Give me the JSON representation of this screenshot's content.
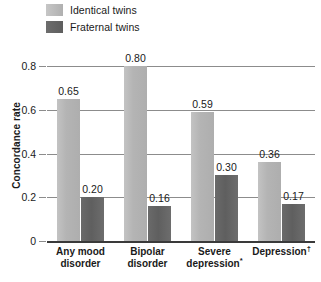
{
  "chart_data": {
    "type": "bar",
    "title": "",
    "subtitle": "",
    "xlabel": "",
    "ylabel": "Concordance rate",
    "ylim": [
      0,
      0.8
    ],
    "grid": true,
    "legend_position": "top-left",
    "categories": [
      "Any mood disorder",
      "Bipolar disorder",
      "Severe depression*",
      "Depression†"
    ],
    "category_lines": [
      [
        "Any mood",
        "disorder"
      ],
      [
        "Bipolar",
        "disorder"
      ],
      [
        "Severe",
        "depression*"
      ],
      [
        "Depression†",
        ""
      ]
    ],
    "y_ticks": [
      "0",
      "0.2",
      "0.4",
      "0.6",
      "0.8"
    ],
    "y_tick_values": [
      0,
      0.2,
      0.4,
      0.6,
      0.8
    ],
    "series": [
      {
        "name": "Identical twins",
        "color": "#b4b4b4",
        "values": [
          0.65,
          0.8,
          0.59,
          0.36
        ],
        "labels": [
          "0.65",
          "0.80",
          "0.59",
          "0.36"
        ]
      },
      {
        "name": "Fraternal twins",
        "color": "#636363",
        "values": [
          0.2,
          0.16,
          0.3,
          0.17
        ],
        "labels": [
          "0.20",
          "0.16",
          "0.30",
          "0.17"
        ]
      }
    ]
  },
  "legend": {
    "items": [
      {
        "label": "Identical twins",
        "color": "#b4b4b4"
      },
      {
        "label": "Fraternal twins",
        "color": "#636363"
      }
    ]
  },
  "axes": {
    "y_title": "Concordance rate"
  }
}
